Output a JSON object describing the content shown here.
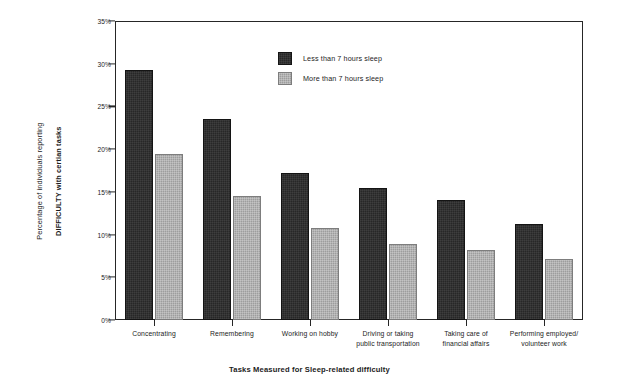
{
  "chart_data": {
    "type": "bar",
    "title": "",
    "xlabel": "Tasks Measured for Sleep-related difficulty",
    "ylabel_line1": "Percentage of individuals reporting",
    "ylabel_line2": "DIFFICULTY with certian tasks",
    "categories": [
      "Concentrating",
      "Remembering",
      "Working on hobby",
      "Driving or taking\npublic transportation",
      "Taking care of\nfinancial affairs",
      "Performing employed/\nvolunteer work"
    ],
    "series": [
      {
        "name": "Less than 7 hours sleep",
        "color": "#272727",
        "values": [
          29.3,
          23.5,
          17.2,
          15.5,
          14.0,
          11.2
        ]
      },
      {
        "name": "More than 7 hours sleep",
        "color": "#9d9d9d",
        "values": [
          19.4,
          14.5,
          10.8,
          8.9,
          8.2,
          7.2
        ]
      }
    ],
    "ylim": [
      0,
      35
    ],
    "ytick_labels": [
      "0%",
      "5%",
      "10%",
      "15%",
      "20%",
      "25%",
      "30%",
      "35%"
    ],
    "ytick_values": [
      0,
      5,
      10,
      15,
      20,
      25,
      30,
      35
    ],
    "grid": false,
    "legend_position": "inside-top-center"
  }
}
